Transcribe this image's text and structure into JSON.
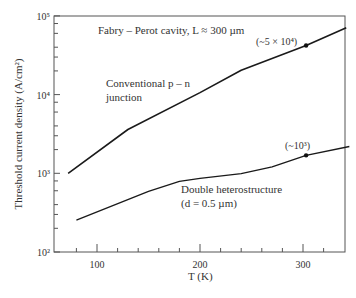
{
  "chart_data": {
    "type": "line",
    "title": "",
    "annotation_top": "Fabry – Perot cavity, L ≈ 300 µm",
    "xlabel": "T (K)",
    "ylabel": "Threshold current density (A/cm²)",
    "xscale": "linear",
    "yscale": "log",
    "xlim": [
      58,
      342
    ],
    "ylim": [
      100,
      100000
    ],
    "xticks_major": [
      100,
      200,
      300
    ],
    "xticks_minor": [
      80,
      120,
      140,
      160,
      180,
      220,
      240,
      260,
      280,
      320
    ],
    "yticks": [
      100,
      1000,
      10000,
      100000
    ],
    "ytick_labels": [
      "10²",
      "10³",
      "10⁴",
      "10⁵"
    ],
    "grid": false,
    "legend": "none (inline labels)",
    "series": [
      {
        "name": "Conventional p – n junction",
        "label_lines": [
          "Conventional p – n",
          "junction"
        ],
        "x": [
          72,
          130,
          200,
          240,
          303,
          342
        ],
        "y": [
          1000,
          3600,
          10600,
          20400,
          42000,
          70800
        ],
        "marker": {
          "x": 303,
          "y": 42000,
          "label": "(~5 × 10⁴)"
        }
      },
      {
        "name": "Double heterostructure (d = 0.5 µm)",
        "label_lines": [
          "Double heterostructure",
          "(d = 0.5 µm)"
        ],
        "x": [
          80,
          150,
          180,
          200,
          240,
          270,
          303,
          345
        ],
        "y": [
          254,
          590,
          790,
          860,
          990,
          1210,
          1690,
          2190
        ],
        "marker": {
          "x": 303,
          "y": 1690,
          "label": "(~10³)"
        }
      }
    ]
  }
}
